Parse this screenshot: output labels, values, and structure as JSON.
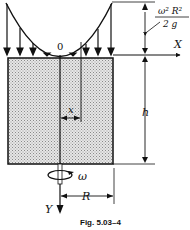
{
  "figure": {
    "caption": "Fig. 5.03–4",
    "labels": {
      "origin": "0",
      "x_axis": "X",
      "y_axis": "Y",
      "x_dim": "x",
      "height": "h",
      "radius": "R",
      "omega": "ω",
      "head_numerator": "ω² R²",
      "head_denominator": "2 g"
    },
    "colors": {
      "ink": "#111111",
      "fill": "#d9d9d9",
      "background": "#ffffff"
    }
  }
}
